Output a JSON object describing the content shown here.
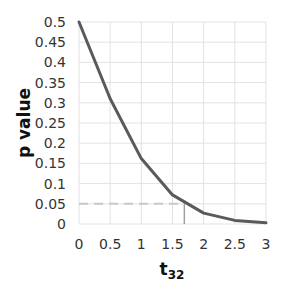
{
  "chart_data": {
    "type": "line",
    "title": "",
    "xlabel": "t",
    "xlabel_subscript": "32",
    "ylabel": "p value",
    "xlim": [
      0,
      3
    ],
    "ylim": [
      0,
      0.5
    ],
    "grid": true,
    "legend": null,
    "x_ticks": [
      "0",
      "0.5",
      "1",
      "1.5",
      "2",
      "2.5",
      "3"
    ],
    "y_ticks": [
      "0",
      "0.05",
      "0.1",
      "0.15",
      "0.2",
      "0.25",
      "0.3",
      "0.35",
      "0.4",
      "0.45",
      "0.5"
    ],
    "series": [
      {
        "name": "p value curve",
        "color": "#5a5a5a",
        "x": [
          0,
          0.5,
          1,
          1.5,
          2,
          2.5,
          3
        ],
        "y": [
          0.5,
          0.31,
          0.162,
          0.072,
          0.027,
          0.009,
          0.003
        ]
      }
    ],
    "annotations": [
      {
        "type": "hline-dashed",
        "y": 0.05,
        "x_from": 0,
        "x_to": 1.69,
        "color": "#c8c8c8"
      },
      {
        "type": "vline",
        "x": 1.69,
        "y_from": 0,
        "y_to": 0.05,
        "color": "#a0a0a0"
      }
    ]
  },
  "colors": {
    "grid": "#e2e2e2",
    "line": "#5a5a5a",
    "dashed": "#c8c8c8",
    "vline": "#a0a0a0"
  }
}
